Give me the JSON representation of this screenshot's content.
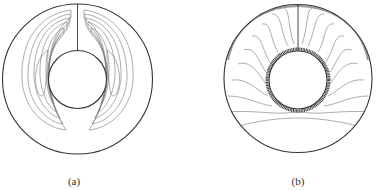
{
  "figure": {
    "panels": [
      {
        "id": "a",
        "label": "(a)",
        "description": "streamlines: two symmetric recirculating cells in annulus"
      },
      {
        "id": "b",
        "label": "(b)",
        "description": "isotherms: plume above inner cylinder"
      }
    ],
    "colors": {
      "line": "#555555",
      "boundary": "#333333",
      "background": "#ffffff"
    }
  }
}
